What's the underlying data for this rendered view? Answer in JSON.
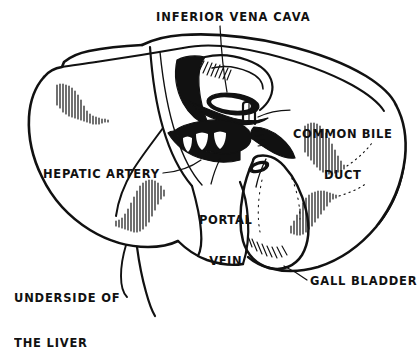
{
  "figure": {
    "title": "Underside of the Liver",
    "medium": "hand-drawn black ink line illustration",
    "ink_color": "#111111",
    "background_color": "#ffffff"
  },
  "labels": {
    "inferior_vena_cava": "INFERIOR VENA CAVA",
    "common_bile_duct_line1": "COMMON BILE",
    "common_bile_duct_line2": "DUCT",
    "hepatic_artery": "HEPATIC ARTERY",
    "portal_vein_line1": "PORTAL",
    "portal_vein_line2": "VEIN",
    "gall_bladder": "GALL BLADDER",
    "caption_line1": "UNDERSIDE OF",
    "caption_line2": "THE LIVER"
  },
  "structures": [
    {
      "name": "inferior-vena-cava",
      "label": "INFERIOR VENA CAVA"
    },
    {
      "name": "common-bile-duct",
      "label": "COMMON BILE DUCT"
    },
    {
      "name": "hepatic-artery",
      "label": "HEPATIC ARTERY"
    },
    {
      "name": "portal-vein",
      "label": "PORTAL VEIN"
    },
    {
      "name": "gall-bladder",
      "label": "GALL BLADDER"
    },
    {
      "name": "liver",
      "label": "UNDERSIDE OF THE LIVER"
    }
  ]
}
